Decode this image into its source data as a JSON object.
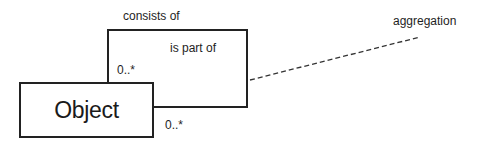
{
  "diagram": {
    "type": "uml-class-aggregation",
    "class": {
      "name": "Object"
    },
    "association": {
      "kind": "self-aggregation",
      "role_whole": "consists of",
      "role_part": "is part of",
      "multiplicity_top": "0..*",
      "multiplicity_right": "0..*"
    },
    "annotation": {
      "label": "aggregation",
      "line_style": "dashed"
    },
    "colors": {
      "stroke": "#222222",
      "text": "#1e1e1e",
      "background": "#ffffff"
    }
  }
}
